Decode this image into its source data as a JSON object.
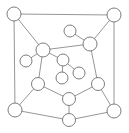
{
  "figure": {
    "width": 129,
    "height": 133,
    "background_color": "#ffffff",
    "node_fill_color": "#ffffff",
    "node_stroke_color": "#6e6e6e",
    "edge_color": "#8a8a8a",
    "node_radius": 6.5,
    "node_count": 15,
    "edge_count": 20
  },
  "chart_data": {
    "type": "scatter",
    "xlabel": "",
    "ylabel": "",
    "xlim": [
      0,
      129
    ],
    "ylim": [
      0,
      133
    ],
    "grid": false,
    "legend": "none",
    "nodes": [
      {
        "id": "n1",
        "label": "",
        "x": 14,
        "y": 14,
        "r": 7.0,
        "role": "corner-top-left"
      },
      {
        "id": "n2",
        "label": "",
        "x": 114,
        "y": 15,
        "r": 7.0,
        "role": "corner-top-right"
      },
      {
        "id": "n3",
        "label": "",
        "x": 43,
        "y": 50,
        "r": 7.0,
        "role": "hub-left"
      },
      {
        "id": "n4",
        "label": "",
        "x": 90,
        "y": 44,
        "r": 7.0,
        "role": "hub-right"
      },
      {
        "id": "n5",
        "label": "",
        "x": 70,
        "y": 31,
        "r": 6.0,
        "role": "leaf-top-center"
      },
      {
        "id": "n6",
        "label": "",
        "x": 26,
        "y": 61,
        "r": 6.0,
        "role": "leaf-left"
      },
      {
        "id": "n7",
        "label": "",
        "x": 63,
        "y": 60,
        "r": 6.0,
        "role": "inner-center"
      },
      {
        "id": "n8",
        "label": "",
        "x": 79,
        "y": 73,
        "r": 6.0,
        "role": "leaf-inner-right"
      },
      {
        "id": "n9",
        "label": "",
        "x": 62,
        "y": 78,
        "r": 6.0,
        "role": "leaf-inner-bottom"
      },
      {
        "id": "n10",
        "label": "",
        "x": 38,
        "y": 84,
        "r": 6.5,
        "role": "mid-lower-left"
      },
      {
        "id": "n11",
        "label": "",
        "x": 98,
        "y": 84,
        "r": 6.5,
        "role": "mid-lower-right"
      },
      {
        "id": "n12",
        "label": "",
        "x": 69,
        "y": 99,
        "r": 6.5,
        "role": "bottom-center-upper"
      },
      {
        "id": "n13",
        "label": "",
        "x": 69,
        "y": 120,
        "r": 6.5,
        "role": "bottom-center"
      },
      {
        "id": "n14",
        "label": "",
        "x": 15,
        "y": 110,
        "r": 7.0,
        "role": "corner-bottom-left"
      },
      {
        "id": "n15",
        "label": "",
        "x": 114,
        "y": 111,
        "r": 7.0,
        "role": "corner-bottom-right"
      }
    ],
    "edges": [
      {
        "source": "n1",
        "target": "n2"
      },
      {
        "source": "n1",
        "target": "n3"
      },
      {
        "source": "n1",
        "target": "n14"
      },
      {
        "source": "n2",
        "target": "n4"
      },
      {
        "source": "n2",
        "target": "n15"
      },
      {
        "source": "n3",
        "target": "n4"
      },
      {
        "source": "n3",
        "target": "n6"
      },
      {
        "source": "n3",
        "target": "n7"
      },
      {
        "source": "n3",
        "target": "n10"
      },
      {
        "source": "n4",
        "target": "n5"
      },
      {
        "source": "n4",
        "target": "n11"
      },
      {
        "source": "n7",
        "target": "n8"
      },
      {
        "source": "n7",
        "target": "n9"
      },
      {
        "source": "n10",
        "target": "n12"
      },
      {
        "source": "n10",
        "target": "n14"
      },
      {
        "source": "n11",
        "target": "n12"
      },
      {
        "source": "n11",
        "target": "n15"
      },
      {
        "source": "n12",
        "target": "n13"
      },
      {
        "source": "n13",
        "target": "n14"
      },
      {
        "source": "n13",
        "target": "n15"
      }
    ]
  }
}
